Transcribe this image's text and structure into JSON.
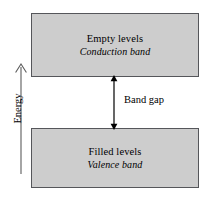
{
  "figure": {
    "kind": "band-gap-energy-diagram",
    "background_color": "#ffffff"
  },
  "conduction_band": {
    "title": "Empty levels",
    "subtitle": "Conduction band",
    "fill_color": "#cdcdcd",
    "border_color": "#55565a"
  },
  "valence_band": {
    "title": "Filled levels",
    "subtitle": "Valence band",
    "fill_color": "#cdcdcd",
    "border_color": "#55565a"
  },
  "band_gap": {
    "label": "Band gap",
    "arrow_name": "double-headed-vertical-arrow",
    "color": "#000000"
  },
  "energy_axis": {
    "label": "Energy",
    "arrow_name": "up-arrow",
    "direction": "up",
    "color": "#000000"
  }
}
